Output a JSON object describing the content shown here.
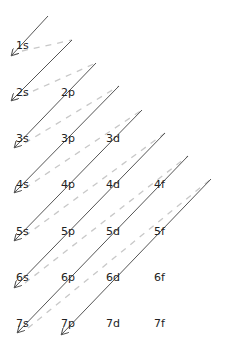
{
  "colors": {
    "arrow": "#555555",
    "dash": "#c8c8c8",
    "text": "#222222",
    "background": "#ffffff"
  },
  "rows": [
    {
      "n": 1,
      "orbitals": [
        "1s"
      ]
    },
    {
      "n": 2,
      "orbitals": [
        "2s",
        "2p"
      ]
    },
    {
      "n": 3,
      "orbitals": [
        "3s",
        "3p",
        "3d"
      ]
    },
    {
      "n": 4,
      "orbitals": [
        "4s",
        "4p",
        "4d",
        "4f"
      ]
    },
    {
      "n": 5,
      "orbitals": [
        "5s",
        "5p",
        "5d",
        "5f"
      ]
    },
    {
      "n": 6,
      "orbitals": [
        "6s",
        "6p",
        "6d",
        "6f"
      ]
    },
    {
      "n": 7,
      "orbitals": [
        "7s",
        "7p",
        "7d",
        "7f"
      ]
    }
  ],
  "filling_order": [
    "1s",
    "2s",
    "2p",
    "3s",
    "3p",
    "4s",
    "3d",
    "4p",
    "5s",
    "4d",
    "5p",
    "6s",
    "4f",
    "5d",
    "6p",
    "7s",
    "5f",
    "6d",
    "7p"
  ],
  "arrows": [
    {
      "x1": 48,
      "y1": 16,
      "x2": 12,
      "y2": 55
    },
    {
      "x1": 72,
      "y1": 40,
      "x2": 12,
      "y2": 100
    },
    {
      "x1": 96,
      "y1": 63,
      "x2": 15,
      "y2": 147
    },
    {
      "x1": 119,
      "y1": 86,
      "x2": 15,
      "y2": 192
    },
    {
      "x1": 142,
      "y1": 110,
      "x2": 15,
      "y2": 240
    },
    {
      "x1": 165,
      "y1": 133,
      "x2": 15,
      "y2": 287
    },
    {
      "x1": 188,
      "y1": 156,
      "x2": 18,
      "y2": 332
    },
    {
      "x1": 211,
      "y1": 179,
      "x2": 62,
      "y2": 334
    }
  ]
}
